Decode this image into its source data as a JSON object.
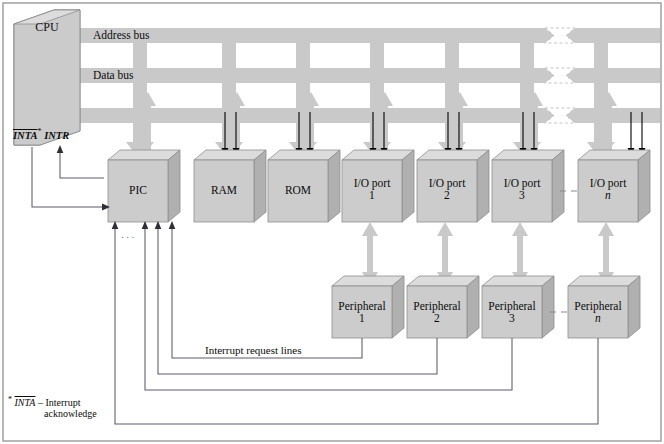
{
  "diagram": {
    "colors": {
      "bus_fill": "#c9c9c9",
      "box_front": "#cccccc",
      "box_top": "#dcdcdc",
      "box_side": "#b0b0b0",
      "arrow_fill": "#c9c9c9",
      "line": "#4a4a55",
      "control_arrow": "#000000",
      "frame": "#9a9a9a",
      "text": "#0b0b0b",
      "break_fill": "#ffffff"
    },
    "buses": [
      {
        "name": "address-bus",
        "label": "Address bus",
        "y": 28
      },
      {
        "name": "data-bus",
        "label": "Data bus",
        "y": 68
      },
      {
        "name": "control-bus",
        "label": "",
        "y": 108
      }
    ],
    "cpu": {
      "label": "CPU"
    },
    "cpu_signals": {
      "inta": "INTA",
      "asterisk": "*",
      "intr": "INTR"
    },
    "devices": [
      {
        "name": "pic",
        "label": "PIC",
        "index": ""
      },
      {
        "name": "ram",
        "label": "RAM",
        "index": ""
      },
      {
        "name": "rom",
        "label": "ROM",
        "index": ""
      },
      {
        "name": "io-port-1",
        "label": "I/O port",
        "index": "1"
      },
      {
        "name": "io-port-2",
        "label": "I/O port",
        "index": "2"
      },
      {
        "name": "io-port-3",
        "label": "I/O port",
        "index": "3"
      },
      {
        "name": "io-port-n",
        "label": "I/O port",
        "index": "n"
      }
    ],
    "peripherals": [
      {
        "name": "peripheral-1",
        "label": "Peripheral",
        "index": "1"
      },
      {
        "name": "peripheral-2",
        "label": "Peripheral",
        "index": "2"
      },
      {
        "name": "peripheral-3",
        "label": "Peripheral",
        "index": "3"
      },
      {
        "name": "peripheral-n",
        "label": "Peripheral",
        "index": "n"
      }
    ],
    "interrupt_lines_label": "Interrupt request lines",
    "ellipsis": "...",
    "footnote": {
      "asterisk": "*",
      "signal": "INTA",
      "dash": "– Interrupt",
      "second_line": "acknowledge"
    }
  }
}
